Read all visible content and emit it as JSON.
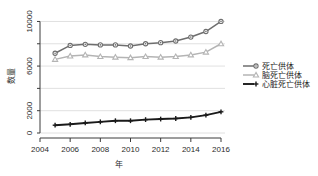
{
  "chart_data": {
    "type": "line",
    "title": "",
    "xlabel": "年",
    "ylabel": "数量",
    "x": [
      2005,
      2006,
      2007,
      2008,
      2009,
      2010,
      2011,
      2012,
      2013,
      2014,
      2015,
      2016
    ],
    "xlim": [
      2004,
      2016
    ],
    "ylim": [
      0,
      10400
    ],
    "xticks": [
      2004,
      2006,
      2008,
      2010,
      2012,
      2014,
      2016
    ],
    "xtick_labels": [
      "2004",
      "2006",
      "2008",
      "2010",
      "2012",
      "2014",
      "2016"
    ],
    "yticks": [
      0,
      2000,
      4000,
      6000,
      8000,
      10000
    ],
    "ytick_labels": [
      "0",
      "2000",
      "",
      "6000",
      "",
      "10000"
    ],
    "grid": true,
    "grid_axis": "y",
    "legend_position": "right",
    "series": [
      {
        "name": "死亡供体",
        "marker": "circle",
        "color": "#6e6e6e",
        "values": [
          7150,
          7850,
          7950,
          7900,
          7900,
          7800,
          8000,
          8100,
          8250,
          8600,
          9100,
          10000
        ]
      },
      {
        "name": "脑死亡供体",
        "marker": "triangle",
        "color": "#b4b4b4",
        "values": [
          6600,
          6900,
          7000,
          6850,
          6800,
          6750,
          6850,
          6800,
          6850,
          7000,
          7250,
          8000
        ]
      },
      {
        "name": "心脏死亡供体",
        "marker": "plus",
        "color": "#1a1a1a",
        "values": [
          700,
          780,
          900,
          1000,
          1100,
          1100,
          1200,
          1250,
          1300,
          1400,
          1600,
          1900
        ]
      }
    ]
  },
  "axes": {
    "y_title": "数量",
    "x_title": "年"
  },
  "legend": {
    "items": [
      {
        "label": "死亡供体",
        "marker": "circle-marker",
        "color": "#6e6e6e"
      },
      {
        "label": "脑死亡供体",
        "marker": "triangle-marker",
        "color": "#b4b4b4"
      },
      {
        "label": "心脏死亡供体",
        "marker": "plus-marker",
        "color": "#1a1a1a"
      }
    ]
  }
}
